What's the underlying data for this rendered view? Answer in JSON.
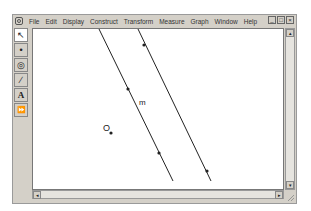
{
  "menubar": {
    "items": [
      "File",
      "Edit",
      "Display",
      "Construct",
      "Transform",
      "Measure",
      "Graph",
      "Window",
      "Help"
    ]
  },
  "window_controls": {
    "minimize": "_",
    "maximize": "□",
    "close": "×"
  },
  "toolbox": {
    "tools": [
      {
        "name": "selection-arrow",
        "glyph": "↖"
      },
      {
        "name": "point",
        "glyph": "•"
      },
      {
        "name": "compass",
        "glyph": "◎"
      },
      {
        "name": "straightedge",
        "glyph": "∕"
      },
      {
        "name": "text",
        "glyph": "A"
      },
      {
        "name": "custom-tool",
        "glyph": "⏩"
      }
    ]
  },
  "canvas": {
    "labels": {
      "line_label": "m",
      "point_label": "O"
    }
  },
  "scrollbars": {
    "up": "▴",
    "down": "▾",
    "left": "◂",
    "right": "▸"
  }
}
